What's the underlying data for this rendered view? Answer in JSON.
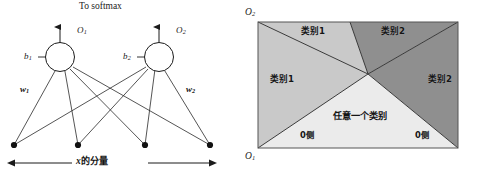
{
  "figure": {
    "width": 480,
    "height": 180,
    "background": "#ffffff"
  },
  "left_panel": {
    "name": "softmax-network-diagram",
    "title": "To softmax",
    "output_labels": [
      {
        "id": "o1",
        "base": "O",
        "sub": "1"
      },
      {
        "id": "o2",
        "base": "O",
        "sub": "2"
      }
    ],
    "bias_labels": [
      {
        "id": "b1",
        "base": "b",
        "sub": "1"
      },
      {
        "id": "b2",
        "base": "b",
        "sub": "2"
      }
    ],
    "weight_labels": [
      {
        "id": "w1",
        "base": "w",
        "sub": "1"
      },
      {
        "id": "w2",
        "base": "w",
        "sub": "2"
      }
    ],
    "input_axis_label": {
      "latin": "x",
      "cjk": "的分量"
    },
    "input_node_count": 4,
    "neuron_count": 2,
    "stroke_color": "#1b1b1b",
    "node_fill": "#ffffff"
  },
  "right_panel": {
    "name": "decision-region-plot",
    "axis_labels": {
      "vertical": {
        "base": "O",
        "sub": "2"
      },
      "horizontal": {
        "base": "O",
        "sub": "1"
      }
    },
    "regions": [
      {
        "id": "top-left",
        "label": "类别1",
        "shade": "#c9c9c9"
      },
      {
        "id": "left",
        "label": "类别1",
        "shade": "#c9c9c9"
      },
      {
        "id": "top-right",
        "label": "类别2",
        "shade": "#8f8f8f"
      },
      {
        "id": "right",
        "label": "类别2",
        "shade": "#8f8f8f"
      },
      {
        "id": "bottom",
        "label": "任意一个类别",
        "shade": "#ebebeb"
      }
    ],
    "zero_side_labels": [
      {
        "id": "zero-left",
        "text": "0侧"
      },
      {
        "id": "zero-right",
        "text": "0侧"
      }
    ],
    "colors": {
      "light_gray": "#c9c9c9",
      "dark_gray": "#8f8f8f",
      "pale": "#ebebeb",
      "border": "#3a3a3a"
    }
  }
}
